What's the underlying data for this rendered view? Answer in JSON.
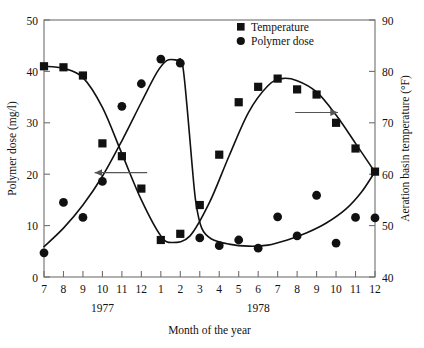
{
  "chart_data": {
    "type": "scatter",
    "title": "",
    "xlabel": "Month of the year",
    "ylabel": "Polymer dose (mg/l)",
    "y2label": "Aeration basin temperature (°F)",
    "xlim": [
      7,
      24
    ],
    "ylim": [
      0,
      50
    ],
    "y2lim": [
      40,
      90
    ],
    "grid": false,
    "legend_position": "top-right",
    "xticks": [
      "7",
      "8",
      "9",
      "10",
      "11",
      "12",
      "1",
      "2",
      "3",
      "4",
      "5",
      "6",
      "7",
      "8",
      "9",
      "10",
      "11",
      "12"
    ],
    "xtick_values": [
      7,
      8,
      9,
      10,
      11,
      12,
      13,
      14,
      15,
      16,
      17,
      18,
      19,
      20,
      21,
      22,
      23,
      24
    ],
    "yticks": [
      "0",
      "10",
      "20",
      "30",
      "40",
      "50"
    ],
    "ytick_values": [
      0,
      10,
      20,
      30,
      40,
      50
    ],
    "y2ticks": [
      "40",
      "50",
      "60",
      "70",
      "80",
      "90"
    ],
    "y2tick_values": [
      40,
      50,
      60,
      70,
      80,
      90
    ],
    "group_labels": [
      {
        "text": "1977",
        "x": 10
      },
      {
        "text": "1978",
        "x": 18
      }
    ],
    "annotations": [
      {
        "name": "left-arrow-polymer-dose",
        "x1": 12.3,
        "y1": 20.3,
        "x2": 9.6,
        "y2": 20.3,
        "direction": "left"
      },
      {
        "name": "right-arrow-temperature",
        "x1": 19.9,
        "y1": 72.0,
        "x2": 22.1,
        "y2": 72.0,
        "direction": "right",
        "axis": "right"
      }
    ],
    "series": [
      {
        "name": "Temperature",
        "marker": "square",
        "axis": "right",
        "color": "#111111",
        "points": [
          {
            "x": 7,
            "y": 81.0
          },
          {
            "x": 8,
            "y": 80.8
          },
          {
            "x": 9,
            "y": 79.2
          },
          {
            "x": 10,
            "y": 66.0
          },
          {
            "x": 11,
            "y": 63.5
          },
          {
            "x": 12,
            "y": 57.2
          },
          {
            "x": 13,
            "y": 47.2
          },
          {
            "x": 14,
            "y": 48.4
          },
          {
            "x": 15,
            "y": 54.0
          },
          {
            "x": 16,
            "y": 63.8
          },
          {
            "x": 17,
            "y": 74.0
          },
          {
            "x": 18,
            "y": 77.0
          },
          {
            "x": 19,
            "y": 78.6
          },
          {
            "x": 20,
            "y": 76.5
          },
          {
            "x": 21,
            "y": 75.5
          },
          {
            "x": 22,
            "y": 70.0
          },
          {
            "x": 23,
            "y": 65.0
          },
          {
            "x": 24,
            "y": 60.5
          }
        ],
        "fit_curve": [
          {
            "x": 7.0,
            "y": 81.0
          },
          {
            "x": 8.0,
            "y": 80.6
          },
          {
            "x": 9.0,
            "y": 78.8
          },
          {
            "x": 10.0,
            "y": 73.0
          },
          {
            "x": 11.0,
            "y": 64.0
          },
          {
            "x": 12.0,
            "y": 55.0
          },
          {
            "x": 13.0,
            "y": 48.0
          },
          {
            "x": 13.6,
            "y": 46.7
          },
          {
            "x": 14.5,
            "y": 48.0
          },
          {
            "x": 15.5,
            "y": 54.5
          },
          {
            "x": 16.5,
            "y": 63.5
          },
          {
            "x": 17.5,
            "y": 72.0
          },
          {
            "x": 18.5,
            "y": 77.2
          },
          {
            "x": 19.2,
            "y": 78.6
          },
          {
            "x": 20.0,
            "y": 78.2
          },
          {
            "x": 21.0,
            "y": 76.0
          },
          {
            "x": 22.0,
            "y": 71.5
          },
          {
            "x": 23.0,
            "y": 66.0
          },
          {
            "x": 24.0,
            "y": 60.4
          }
        ]
      },
      {
        "name": "Polymer dose",
        "marker": "circle",
        "axis": "left",
        "color": "#111111",
        "points": [
          {
            "x": 7,
            "y": 4.7
          },
          {
            "x": 8,
            "y": 14.5
          },
          {
            "x": 9,
            "y": 11.6
          },
          {
            "x": 10,
            "y": 18.6
          },
          {
            "x": 11,
            "y": 33.2
          },
          {
            "x": 12,
            "y": 37.6
          },
          {
            "x": 13,
            "y": 42.4
          },
          {
            "x": 14,
            "y": 41.6
          },
          {
            "x": 15,
            "y": 7.6
          },
          {
            "x": 16,
            "y": 6.1
          },
          {
            "x": 17,
            "y": 7.2
          },
          {
            "x": 18,
            "y": 5.6
          },
          {
            "x": 19,
            "y": 11.7
          },
          {
            "x": 20,
            "y": 8.0
          },
          {
            "x": 21,
            "y": 15.9
          },
          {
            "x": 22,
            "y": 6.6
          },
          {
            "x": 23,
            "y": 11.6
          },
          {
            "x": 24,
            "y": 11.5
          }
        ],
        "fit_curve": [
          {
            "x": 7.0,
            "y": 5.9
          },
          {
            "x": 8.0,
            "y": 9.5
          },
          {
            "x": 9.0,
            "y": 14.0
          },
          {
            "x": 10.0,
            "y": 19.6
          },
          {
            "x": 11.0,
            "y": 26.5
          },
          {
            "x": 12.0,
            "y": 34.0
          },
          {
            "x": 12.8,
            "y": 39.8
          },
          {
            "x": 13.3,
            "y": 42.1
          },
          {
            "x": 13.8,
            "y": 42.2
          },
          {
            "x": 14.1,
            "y": 41.6
          },
          {
            "x": 14.35,
            "y": 33.0
          },
          {
            "x": 14.6,
            "y": 22.0
          },
          {
            "x": 14.8,
            "y": 14.5
          },
          {
            "x": 15.1,
            "y": 9.5
          },
          {
            "x": 15.6,
            "y": 7.4
          },
          {
            "x": 16.5,
            "y": 6.4
          },
          {
            "x": 17.5,
            "y": 6.0
          },
          {
            "x": 18.5,
            "y": 6.2
          },
          {
            "x": 19.5,
            "y": 7.2
          },
          {
            "x": 20.5,
            "y": 8.6
          },
          {
            "x": 21.5,
            "y": 10.5
          },
          {
            "x": 22.5,
            "y": 13.2
          },
          {
            "x": 23.3,
            "y": 16.5
          },
          {
            "x": 23.9,
            "y": 19.9
          }
        ]
      }
    ],
    "legend": [
      {
        "label": "Temperature",
        "marker": "square"
      },
      {
        "label": "Polymer dose",
        "marker": "circle"
      }
    ]
  }
}
